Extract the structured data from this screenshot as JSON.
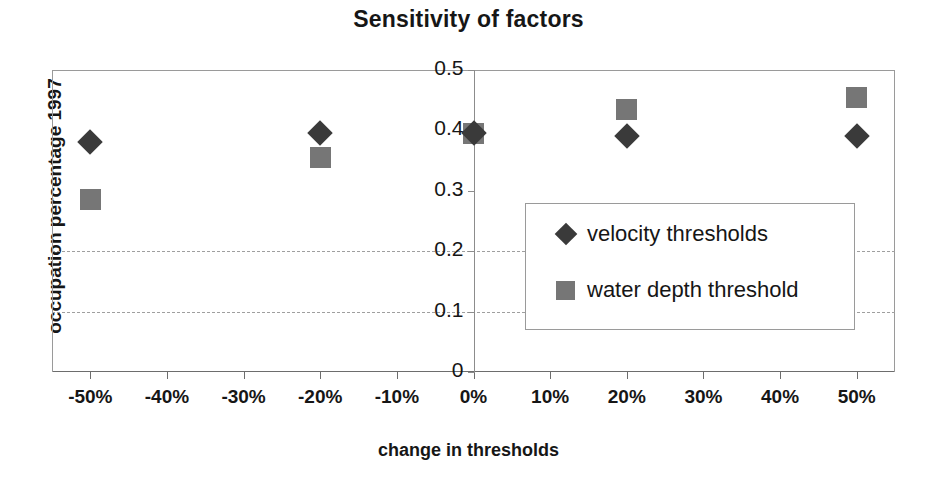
{
  "chart_data": {
    "type": "scatter",
    "title": "Sensitivity of factors",
    "xlabel": "change in thresholds",
    "ylabel": "occupation percentage 1997",
    "x": [
      -50,
      -20,
      0,
      20,
      50
    ],
    "x_tick_labels": [
      "-50%",
      "-40%",
      "-30%",
      "-20%",
      "-10%",
      "0%",
      "10%",
      "20%",
      "30%",
      "40%",
      "50%"
    ],
    "x_tick_values": [
      -50,
      -40,
      -30,
      -20,
      -10,
      0,
      10,
      20,
      30,
      40,
      50
    ],
    "y_tick_labels": [
      "0",
      "0.1",
      "0.2",
      "0.3",
      "0.4",
      "0.5"
    ],
    "y_tick_values": [
      0,
      0.1,
      0.2,
      0.3,
      0.4,
      0.5
    ],
    "xlim": [
      -55,
      55
    ],
    "ylim": [
      0,
      0.5
    ],
    "grid": "horizontal-dashed at 0.1 and 0.2",
    "gridline_values": [
      0.1,
      0.2
    ],
    "legend_position": "center-right inside plot",
    "series": [
      {
        "name": "velocity thresholds",
        "marker": "diamond",
        "color": "#3a3a3a",
        "x": [
          -50,
          -20,
          0,
          20,
          50
        ],
        "values": [
          0.38,
          0.395,
          0.395,
          0.39,
          0.39
        ]
      },
      {
        "name": "water depth threshold",
        "marker": "square",
        "color": "#767676",
        "x": [
          -50,
          -20,
          0,
          20,
          50
        ],
        "values": [
          0.285,
          0.355,
          0.395,
          0.435,
          0.455
        ]
      }
    ]
  },
  "colors": {
    "velocity_marker": "#3a3a3a",
    "water_depth_marker": "#767676",
    "axis_line": "#8c8c8c",
    "gridline": "#9f9f9f",
    "text": "#161616",
    "background": "#ffffff"
  }
}
